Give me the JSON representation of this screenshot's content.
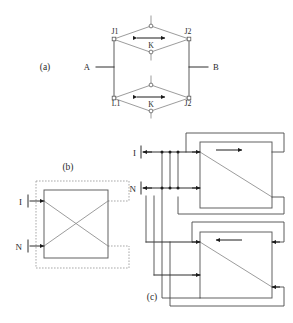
{
  "figure": {
    "background_color": "#ffffff",
    "line_color": "#4a4a4a",
    "accent_color": "#1c1c1c",
    "dashed_color": "#9a9a9a"
  },
  "panels": [
    {
      "id": "a",
      "label": "(a)",
      "description": "Bridge network with upper and lower diamond sub-circuits between terminals A and B"
    },
    {
      "id": "b",
      "label": "(b)",
      "description": "Crossover switch box with dashed feedback paths and I, N inputs"
    },
    {
      "id": "c",
      "label": "(c)",
      "description": "Two cascaded directional boxes with bus routing from I and N inputs"
    }
  ],
  "panel_a": {
    "terminal_left": "A",
    "terminal_right": "B",
    "upper_diamond": {
      "left_node": "J1",
      "right_node": "J2",
      "center_label": "K",
      "arrow": "double-headed-horizontal"
    },
    "lower_diamond": {
      "left_node": "L1",
      "right_node": "J2",
      "center_label": "K",
      "arrow": "double-headed-horizontal"
    }
  },
  "panel_b": {
    "input_top": "I",
    "input_bottom": "N",
    "inner_element": "crossover",
    "feedback_style": "dashed"
  },
  "panel_c": {
    "input_top": "I",
    "input_bottom": "N",
    "boxes": [
      {
        "position": "top",
        "arrow_direction": "right",
        "diagonal": "top-left-to-bottom-right"
      },
      {
        "position": "bottom",
        "arrow_direction": "left",
        "diagonal": "top-left-to-bottom-right"
      }
    ]
  }
}
